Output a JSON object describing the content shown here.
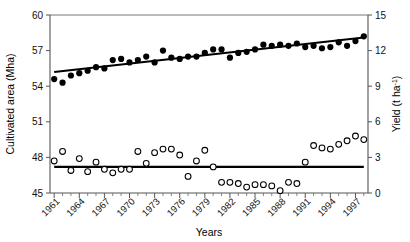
{
  "figure": {
    "name": "cultivated-area-and-yield-timeseries",
    "background_color": "#ffffff",
    "marker_color": "#000000"
  },
  "axes": {
    "x": {
      "title": "Years",
      "tick_labels": [
        "1961",
        "1964",
        "1967",
        "1970",
        "1973",
        "1976",
        "1979",
        "1982",
        "1985",
        "1988",
        "1991",
        "1994",
        "1997"
      ],
      "min": 1960.5,
      "max": 1998.5,
      "minor_tick_interval": 1
    },
    "y_left": {
      "title": "Cultivated area (Mha)",
      "tick_labels": [
        "45",
        "48",
        "51",
        "54",
        "57",
        "60"
      ],
      "min": 45,
      "max": 60,
      "unit": "Mha"
    },
    "y_right": {
      "title_main": "Yield (t ha",
      "title_sup": "-1",
      "title_tail": ")",
      "tick_labels": [
        "0",
        "3",
        "6",
        "9",
        "12",
        "15"
      ],
      "min": 0,
      "max": 15,
      "unit": "t ha-1"
    }
  },
  "chart_data": {
    "type": "scatter",
    "title": "",
    "xlabel": "Years",
    "ylabel": "Cultivated area (Mha)",
    "ylabel_right": "Yield (t ha-1)",
    "xlim": [
      1960.5,
      1998.5
    ],
    "ylim": [
      45,
      60
    ],
    "ylim_right": [
      0,
      15
    ],
    "grid": false,
    "legend": "none",
    "x": [
      1961,
      1962,
      1963,
      1964,
      1965,
      1966,
      1967,
      1968,
      1969,
      1970,
      1971,
      1972,
      1973,
      1974,
      1975,
      1976,
      1977,
      1978,
      1979,
      1980,
      1981,
      1982,
      1983,
      1984,
      1985,
      1986,
      1987,
      1988,
      1989,
      1990,
      1991,
      1992,
      1993,
      1994,
      1995,
      1996,
      1997,
      1998
    ],
    "series": [
      {
        "name": "Cultivated area",
        "marker": "filled-circle",
        "axis": "left",
        "units": "Mha",
        "values": [
          54.6,
          54.3,
          54.9,
          55.1,
          55.3,
          55.6,
          55.5,
          56.2,
          56.3,
          56.0,
          56.2,
          56.5,
          56.0,
          57.0,
          56.4,
          56.3,
          56.5,
          56.5,
          56.8,
          57.1,
          57.1,
          56.4,
          56.8,
          56.9,
          57.1,
          57.5,
          57.4,
          57.5,
          57.4,
          57.6,
          57.3,
          57.4,
          57.2,
          57.3,
          57.7,
          57.4,
          57.8,
          58.2
        ]
      },
      {
        "name": "Yield",
        "marker": "open-circle",
        "axis": "right",
        "units": "t ha-1",
        "values": [
          2.7,
          3.5,
          1.9,
          2.9,
          1.8,
          2.6,
          2.0,
          1.7,
          2.0,
          2.0,
          3.5,
          2.5,
          3.4,
          3.7,
          3.7,
          3.2,
          1.4,
          2.7,
          3.6,
          2.2,
          0.9,
          0.9,
          0.8,
          0.5,
          0.7,
          0.7,
          0.6,
          0.2,
          0.9,
          0.8,
          2.6,
          4.0,
          3.8,
          3.7,
          4.1,
          4.4,
          4.8,
          4.5
        ]
      }
    ],
    "trend_lines": [
      {
        "name": "Cultivated area trend",
        "axis": "left",
        "x_start": 1961,
        "x_end": 1998,
        "y_start": 55.2,
        "y_end": 58.1
      },
      {
        "name": "Yield trend",
        "axis": "right",
        "x_start": 1961,
        "x_end": 1998,
        "y_start": 2.2,
        "y_end": 2.2
      }
    ]
  }
}
